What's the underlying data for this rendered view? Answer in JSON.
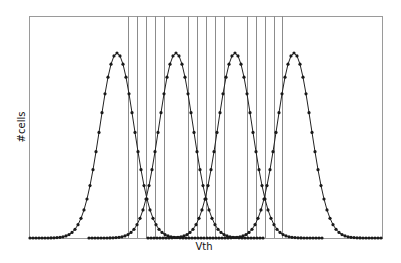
{
  "chart_data": {
    "type": "line",
    "title": "",
    "xlabel": "Vth",
    "ylabel": "#cells",
    "grid": false,
    "legend": null,
    "x_axis": {
      "ticks": false,
      "range_px": [
        29,
        382
      ]
    },
    "y_axis": {
      "ticks": false,
      "range_px": [
        16,
        238
      ]
    },
    "series": [
      {
        "name": "state-0",
        "center_px": 117,
        "sigma_px": 17,
        "peak_px": 53,
        "span_px": [
          30,
          204
        ]
      },
      {
        "name": "state-1",
        "center_px": 176,
        "sigma_px": 17,
        "peak_px": 53,
        "span_px": [
          89,
          263
        ]
      },
      {
        "name": "state-2",
        "center_px": 235,
        "sigma_px": 17,
        "peak_px": 53,
        "span_px": [
          148,
          322
        ]
      },
      {
        "name": "state-3",
        "center_px": 294,
        "sigma_px": 17,
        "peak_px": 53,
        "span_px": [
          207,
          381
        ]
      }
    ],
    "marker_spacing_px": 3,
    "vertical_lines_px": [
      128,
      137,
      146,
      155,
      164,
      188,
      197,
      206,
      215,
      224,
      247,
      256,
      265,
      274,
      282
    ],
    "colors": {
      "curve": "#222222",
      "marker": "#1a1a1a",
      "frame": "#9a9a9a",
      "vlines": "#8c8c8c"
    }
  },
  "labels": {
    "x": "Vth",
    "y": "#cells"
  }
}
